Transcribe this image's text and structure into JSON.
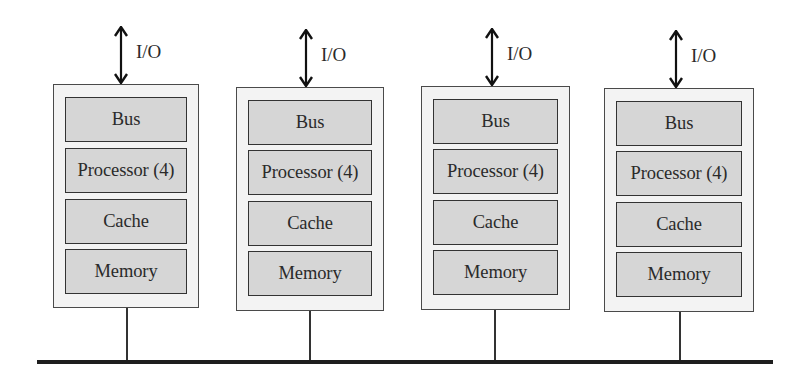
{
  "diagram": {
    "type": "distributed-memory-nodes",
    "io_label": "I/O",
    "nodes": [
      {
        "id": "node-1",
        "components": [
          "Bus",
          "Processor (4)",
          "Cache",
          "Memory"
        ],
        "io": "I/O"
      },
      {
        "id": "node-2",
        "components": [
          "Bus",
          "Processor (4)",
          "Cache",
          "Memory"
        ],
        "io": "I/O"
      },
      {
        "id": "node-3",
        "components": [
          "Bus",
          "Processor (4)",
          "Cache",
          "Memory"
        ],
        "io": "I/O"
      },
      {
        "id": "node-4",
        "components": [
          "Bus",
          "Processor (4)",
          "Cache",
          "Memory"
        ],
        "io": "I/O"
      }
    ],
    "interconnect": "shared network line",
    "colors": {
      "node_fill": "#f3f3f3",
      "component_fill": "#d6d6d6",
      "border": "#333333",
      "bus_line": "#1e1e1e"
    }
  }
}
